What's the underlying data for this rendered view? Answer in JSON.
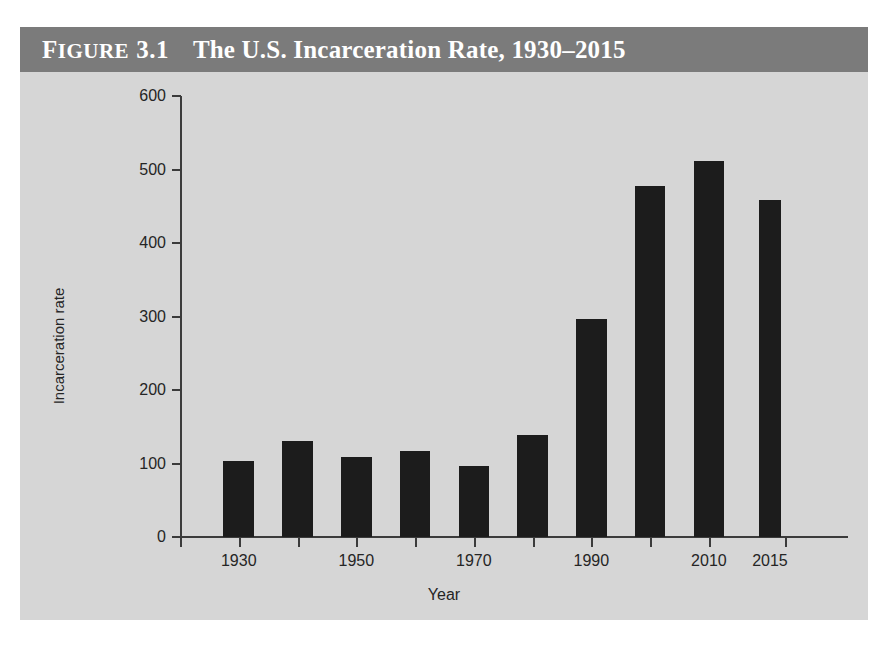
{
  "figure": {
    "label_word": "Figure",
    "label_word_cap": "F",
    "label_word_rest": "IGURE",
    "number": "3.1",
    "title": "The U.S. Incarceration Rate, 1930–2015",
    "header_bg": "#7b7b7b",
    "header_text_color": "#ffffff",
    "panel_bg": "#d6d6d6",
    "bar_color": "#1c1c1c",
    "axis_color": "#3b3b3b"
  },
  "source_note": "",
  "chart_data": {
    "type": "bar",
    "xlabel": "Year",
    "ylabel": "Incarceration rate",
    "categories": [
      "1930",
      "1940",
      "1950",
      "1960",
      "1970",
      "1980",
      "1990",
      "2000",
      "2010",
      "2015"
    ],
    "values": [
      103,
      131,
      109,
      117,
      96,
      139,
      297,
      478,
      512,
      458
    ],
    "ylim": [
      0,
      600
    ],
    "yticks": [
      0,
      100,
      200,
      300,
      400,
      500,
      600
    ],
    "ytick_labels": [
      "0",
      "100",
      "200",
      "300",
      "400",
      "500",
      "600"
    ],
    "xtick_labels": [
      "1930",
      "",
      "1950",
      "",
      "1970",
      "",
      "1990",
      "",
      "2010",
      "2015"
    ],
    "grid": false,
    "legend": "none",
    "note": "1930-2010 shown at 10-year intervals; final bar is 2015"
  }
}
